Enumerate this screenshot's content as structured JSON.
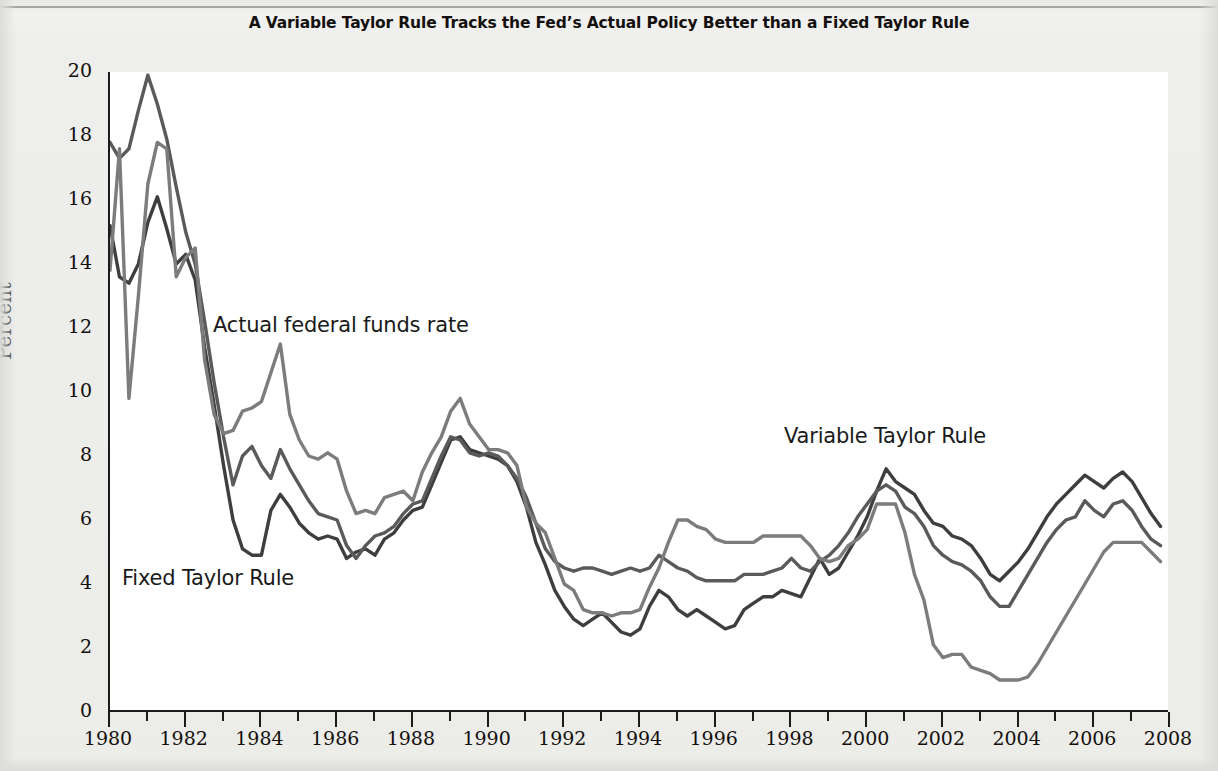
{
  "chart_data": {
    "type": "line",
    "title": "A Variable Taylor Rule Tracks the Fed’s Actual Policy Better than a Fixed Taylor Rule",
    "xlabel": "",
    "ylabel": "Percent",
    "xlim": [
      1980,
      2008
    ],
    "ylim": [
      0,
      20
    ],
    "ytick_step": 2,
    "xtick_step": 2,
    "x_minor_tick_step": 1,
    "grid": false,
    "legend_position": "inline-annotations",
    "yticks": [
      "0",
      "2",
      "4",
      "6",
      "8",
      "10",
      "12",
      "14",
      "16",
      "18",
      "20"
    ],
    "xticks": [
      "1980",
      "1982",
      "1984",
      "1986",
      "1988",
      "1990",
      "1992",
      "1994",
      "1996",
      "1998",
      "2000",
      "2002",
      "2004",
      "2006",
      "2008"
    ],
    "x_minor_ticks": [
      1981,
      1983,
      1985,
      1987,
      1989,
      1991,
      1993,
      1995,
      1997,
      1999,
      2001,
      2003,
      2005,
      2007
    ],
    "series": [
      {
        "name": "Actual federal funds rate",
        "color": "#7c7c7c",
        "annotation": "Actual federal funds rate",
        "x": [
          1980.0,
          1980.25,
          1980.5,
          1980.75,
          1981.0,
          1981.25,
          1981.5,
          1981.75,
          1982.0,
          1982.25,
          1982.5,
          1982.75,
          1983.0,
          1983.25,
          1983.5,
          1983.75,
          1984.0,
          1984.25,
          1984.5,
          1984.75,
          1985.0,
          1985.25,
          1985.5,
          1985.75,
          1986.0,
          1986.25,
          1986.5,
          1986.75,
          1987.0,
          1987.25,
          1987.5,
          1987.75,
          1988.0,
          1988.25,
          1988.5,
          1988.75,
          1989.0,
          1989.25,
          1989.5,
          1989.75,
          1990.0,
          1990.25,
          1990.5,
          1990.75,
          1991.0,
          1991.25,
          1991.5,
          1991.75,
          1992.0,
          1992.25,
          1992.5,
          1992.75,
          1993.0,
          1993.25,
          1993.5,
          1993.75,
          1994.0,
          1994.25,
          1994.5,
          1994.75,
          1995.0,
          1995.25,
          1995.5,
          1995.75,
          1996.0,
          1996.25,
          1996.5,
          1996.75,
          1997.0,
          1997.25,
          1997.5,
          1997.75,
          1998.0,
          1998.25,
          1998.5,
          1998.75,
          1999.0,
          1999.25,
          1999.5,
          1999.75,
          2000.0,
          2000.25,
          2000.5,
          2000.75,
          2001.0,
          2001.25,
          2001.5,
          2001.75,
          2002.0,
          2002.25,
          2002.5,
          2002.75,
          2003.0,
          2003.25,
          2003.5,
          2003.75,
          2004.0,
          2004.25,
          2004.5,
          2004.75,
          2005.0,
          2005.25,
          2005.5,
          2005.75,
          2006.0,
          2006.25,
          2006.5,
          2006.75,
          2007.0,
          2007.25,
          2007.5,
          2007.75
        ],
        "y": [
          13.8,
          17.6,
          9.8,
          13.0,
          16.5,
          17.8,
          17.6,
          13.6,
          14.2,
          14.5,
          11.0,
          9.3,
          8.7,
          8.8,
          9.4,
          9.5,
          9.7,
          10.6,
          11.5,
          9.3,
          8.5,
          8.0,
          7.9,
          8.1,
          7.9,
          6.9,
          6.2,
          6.3,
          6.2,
          6.7,
          6.8,
          6.9,
          6.6,
          7.5,
          8.1,
          8.6,
          9.4,
          9.8,
          9.0,
          8.6,
          8.2,
          8.2,
          8.1,
          7.7,
          6.4,
          5.9,
          5.6,
          4.8,
          4.0,
          3.8,
          3.2,
          3.1,
          3.1,
          3.0,
          3.1,
          3.1,
          3.2,
          3.9,
          4.5,
          5.3,
          6.0,
          6.0,
          5.8,
          5.7,
          5.4,
          5.3,
          5.3,
          5.3,
          5.3,
          5.5,
          5.5,
          5.5,
          5.5,
          5.5,
          5.2,
          4.8,
          4.7,
          4.8,
          5.2,
          5.4,
          5.7,
          6.5,
          6.5,
          6.5,
          5.6,
          4.3,
          3.5,
          2.1,
          1.7,
          1.8,
          1.8,
          1.4,
          1.3,
          1.2,
          1.0,
          1.0,
          1.0,
          1.1,
          1.5,
          2.0,
          2.5,
          3.0,
          3.5,
          4.0,
          4.5,
          5.0,
          5.3,
          5.3,
          5.3,
          5.3,
          5.0,
          4.7
        ]
      },
      {
        "name": "Fixed Taylor Rule",
        "color": "#3e3e3e",
        "annotation": "Fixed Taylor Rule",
        "x": [
          1980.0,
          1980.25,
          1980.5,
          1980.75,
          1981.0,
          1981.25,
          1981.5,
          1981.75,
          1982.0,
          1982.25,
          1982.5,
          1982.75,
          1983.0,
          1983.25,
          1983.5,
          1983.75,
          1984.0,
          1984.25,
          1984.5,
          1984.75,
          1985.0,
          1985.25,
          1985.5,
          1985.75,
          1986.0,
          1986.25,
          1986.5,
          1986.75,
          1987.0,
          1987.25,
          1987.5,
          1987.75,
          1988.0,
          1988.25,
          1988.5,
          1988.75,
          1989.0,
          1989.25,
          1989.5,
          1989.75,
          1990.0,
          1990.25,
          1990.5,
          1990.75,
          1991.0,
          1991.25,
          1991.5,
          1991.75,
          1992.0,
          1992.25,
          1992.5,
          1992.75,
          1993.0,
          1993.25,
          1993.5,
          1993.75,
          1994.0,
          1994.25,
          1994.5,
          1994.75,
          1995.0,
          1995.25,
          1995.5,
          1995.75,
          1996.0,
          1996.25,
          1996.5,
          1996.75,
          1997.0,
          1997.25,
          1997.5,
          1997.75,
          1998.0,
          1998.25,
          1998.5,
          1998.75,
          1999.0,
          1999.25,
          1999.5,
          1999.75,
          2000.0,
          2000.25,
          2000.5,
          2000.75,
          2001.0,
          2001.25,
          2001.5,
          2001.75,
          2002.0,
          2002.25,
          2002.5,
          2002.75,
          2003.0,
          2003.25,
          2003.5,
          2003.75,
          2004.0,
          2004.25,
          2004.5,
          2004.75,
          2005.0,
          2005.25,
          2005.5,
          2005.75,
          2006.0,
          2006.25,
          2006.5,
          2006.75,
          2007.0,
          2007.25,
          2007.5,
          2007.75
        ],
        "y": [
          15.2,
          13.6,
          13.4,
          14.0,
          15.3,
          16.1,
          15.1,
          14.0,
          14.3,
          13.5,
          11.4,
          9.6,
          7.7,
          6.0,
          5.1,
          4.9,
          4.9,
          6.3,
          6.8,
          6.4,
          5.9,
          5.6,
          5.4,
          5.5,
          5.4,
          4.8,
          5.0,
          5.1,
          4.9,
          5.4,
          5.6,
          6.0,
          6.3,
          6.4,
          7.1,
          7.8,
          8.5,
          8.6,
          8.2,
          8.1,
          8.0,
          7.9,
          7.7,
          7.2,
          6.4,
          5.3,
          4.6,
          3.8,
          3.3,
          2.9,
          2.7,
          2.9,
          3.1,
          2.8,
          2.5,
          2.4,
          2.6,
          3.3,
          3.8,
          3.6,
          3.2,
          3.0,
          3.2,
          3.0,
          2.8,
          2.6,
          2.7,
          3.2,
          3.4,
          3.6,
          3.6,
          3.8,
          3.7,
          3.6,
          4.2,
          4.8,
          4.3,
          4.5,
          5.0,
          5.5,
          6.1,
          6.9,
          7.6,
          7.2,
          7.0,
          6.8,
          6.3,
          5.9,
          5.8,
          5.5,
          5.4,
          5.2,
          4.8,
          4.3,
          4.1,
          4.4,
          4.7,
          5.1,
          5.6,
          6.1,
          6.5,
          6.8,
          7.1,
          7.4,
          7.2,
          7.0,
          7.3,
          7.5,
          7.2,
          6.7,
          6.2,
          5.8
        ]
      },
      {
        "name": "Variable Taylor Rule",
        "color": "#5a5a5a",
        "annotation": "Variable Taylor Rule",
        "x": [
          1980.0,
          1980.25,
          1980.5,
          1980.75,
          1981.0,
          1981.25,
          1981.5,
          1981.75,
          1982.0,
          1982.25,
          1982.5,
          1982.75,
          1983.0,
          1983.25,
          1983.5,
          1983.75,
          1984.0,
          1984.25,
          1984.5,
          1984.75,
          1985.0,
          1985.25,
          1985.5,
          1985.75,
          1986.0,
          1986.25,
          1986.5,
          1986.75,
          1987.0,
          1987.25,
          1987.5,
          1987.75,
          1988.0,
          1988.25,
          1988.5,
          1988.75,
          1989.0,
          1989.25,
          1989.5,
          1989.75,
          1990.0,
          1990.25,
          1990.5,
          1990.75,
          1991.0,
          1991.25,
          1991.5,
          1991.75,
          1992.0,
          1992.25,
          1992.5,
          1992.75,
          1993.0,
          1993.25,
          1993.5,
          1993.75,
          1994.0,
          1994.25,
          1994.5,
          1994.75,
          1995.0,
          1995.25,
          1995.5,
          1995.75,
          1996.0,
          1996.25,
          1996.5,
          1996.75,
          1997.0,
          1997.25,
          1997.5,
          1997.75,
          1998.0,
          1998.25,
          1998.5,
          1998.75,
          1999.0,
          1999.25,
          1999.5,
          1999.75,
          2000.0,
          2000.25,
          2000.5,
          2000.75,
          2001.0,
          2001.25,
          2001.5,
          2001.75,
          2002.0,
          2002.25,
          2002.5,
          2002.75,
          2003.0,
          2003.25,
          2003.5,
          2003.75,
          2004.0,
          2004.25,
          2004.5,
          2004.75,
          2005.0,
          2005.25,
          2005.5,
          2005.75,
          2006.0,
          2006.25,
          2006.5,
          2006.75,
          2007.0,
          2007.25,
          2007.5,
          2007.75
        ],
        "y": [
          17.8,
          17.3,
          17.6,
          18.8,
          19.9,
          19.0,
          17.9,
          16.4,
          15.0,
          14.0,
          12.2,
          10.3,
          8.6,
          7.1,
          8.0,
          8.3,
          7.7,
          7.3,
          8.2,
          7.6,
          7.1,
          6.6,
          6.2,
          6.1,
          6.0,
          5.2,
          4.8,
          5.2,
          5.5,
          5.6,
          5.8,
          6.2,
          6.5,
          6.6,
          7.3,
          8.0,
          8.6,
          8.5,
          8.1,
          8.0,
          8.1,
          8.0,
          7.7,
          7.3,
          6.7,
          5.9,
          5.1,
          4.7,
          4.5,
          4.4,
          4.5,
          4.5,
          4.4,
          4.3,
          4.4,
          4.5,
          4.4,
          4.5,
          4.9,
          4.7,
          4.5,
          4.4,
          4.2,
          4.1,
          4.1,
          4.1,
          4.1,
          4.3,
          4.3,
          4.3,
          4.4,
          4.5,
          4.8,
          4.5,
          4.4,
          4.7,
          4.9,
          5.2,
          5.6,
          6.1,
          6.5,
          6.9,
          7.1,
          6.9,
          6.4,
          6.2,
          5.8,
          5.2,
          4.9,
          4.7,
          4.6,
          4.4,
          4.1,
          3.6,
          3.3,
          3.3,
          3.8,
          4.3,
          4.8,
          5.3,
          5.7,
          6.0,
          6.1,
          6.6,
          6.3,
          6.1,
          6.5,
          6.6,
          6.3,
          5.8,
          5.4,
          5.2
        ]
      }
    ]
  },
  "axes": {
    "y_title": "Percent"
  }
}
